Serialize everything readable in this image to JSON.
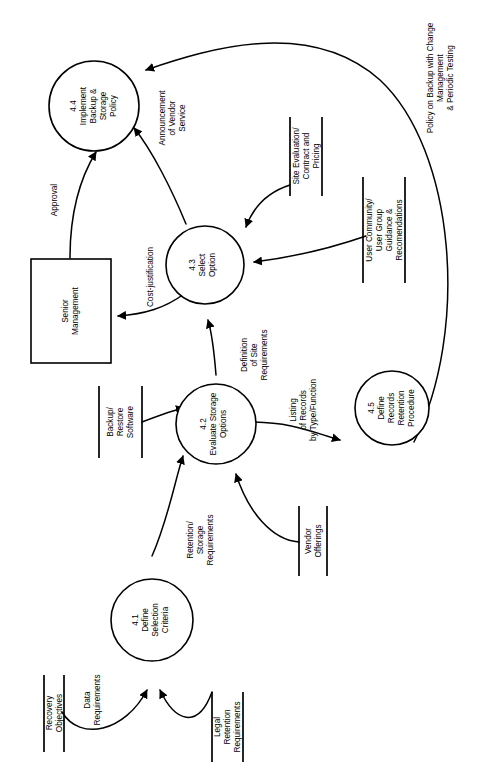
{
  "diagram": {
    "type": "data-flow-diagram",
    "orientation": "rotated-90-ccw",
    "processes": [
      {
        "id": "4.1",
        "number": "4.1",
        "name": "Define Selection Criteria",
        "lines": [
          "4.1",
          "Define",
          "Selection",
          "Criteria"
        ]
      },
      {
        "id": "4.2",
        "number": "4.2",
        "name": "Evaluate Storage Options",
        "lines": [
          "4.2",
          "Evaluate Storage",
          "Options"
        ]
      },
      {
        "id": "4.3",
        "number": "4.3",
        "name": "Select Option",
        "lines": [
          "4.3",
          "Select",
          "Option"
        ]
      },
      {
        "id": "4.4",
        "number": "4.4",
        "name": "Implement Backup & Storage Policy",
        "lines": [
          "4.4",
          "Implement",
          "Backup &",
          "Storage",
          "Policy"
        ]
      },
      {
        "id": "4.5",
        "number": "4.5",
        "name": "Define Records Retention Procedure",
        "lines": [
          "4.5",
          "Define",
          "Records",
          "Retention",
          "Procedure"
        ]
      }
    ],
    "external_entities": [
      {
        "id": "senior-management",
        "name": "Senior Management",
        "lines": [
          "Senior",
          "Management"
        ]
      }
    ],
    "data_stores": [
      {
        "id": "recovery-objectives",
        "name": "Recovery Objectives",
        "lines": [
          "Recovery",
          "Objectives"
        ]
      },
      {
        "id": "legal-retention-requirements",
        "name": "Legal Retention Requirements",
        "lines": [
          "Legal",
          "Retention",
          "Requirements"
        ]
      },
      {
        "id": "backup-restore-software",
        "name": "Backup/ Restore Software",
        "lines": [
          "Backup/",
          "Restore",
          "Software"
        ]
      },
      {
        "id": "vendor-offerings",
        "name": "Vendor Offerings",
        "lines": [
          "Vendor",
          "Offerings"
        ]
      },
      {
        "id": "site-evaluation-contract-pricing",
        "name": "Site Evaluation/ Contract and Pricing",
        "lines": [
          "Site Evaluation/",
          "Contract and",
          "Pricing"
        ]
      },
      {
        "id": "user-community-guidance",
        "name": "User Community/ User Group Guidance & Recomendations",
        "lines": [
          "User Community/",
          "User Group",
          "Guidance &",
          "Recomendations"
        ]
      }
    ],
    "data_flows": [
      {
        "id": "data-requirements",
        "label": "Data Requirements",
        "lines": [
          "Data",
          "Requirements"
        ],
        "from": "recovery-objectives",
        "to": "4.1"
      },
      {
        "id": "legal-to-41",
        "label": "",
        "lines": [],
        "from": "legal-retention-requirements",
        "to": "4.1"
      },
      {
        "id": "retention-storage-requirements",
        "label": "Retention/ Storage Requirements",
        "lines": [
          "Retention/",
          "Storage",
          "Requirements"
        ],
        "from": "4.1",
        "to": "4.2"
      },
      {
        "id": "backup-software-to-42",
        "label": "",
        "lines": [],
        "from": "backup-restore-software",
        "to": "4.2"
      },
      {
        "id": "vendor-offerings-to-42",
        "label": "",
        "lines": [],
        "from": "vendor-offerings",
        "to": "4.2"
      },
      {
        "id": "definition-of-site-requirements",
        "label": "Definition of Site Requirements",
        "lines": [
          "Definition",
          "of Site",
          "Requirements"
        ],
        "from": "4.2",
        "to": "4.3"
      },
      {
        "id": "listing-of-records",
        "label": "Listing of Records by Type/Function",
        "lines": [
          "Listing",
          "of Records",
          "by Type/Function"
        ],
        "from": "4.2",
        "to": "4.5"
      },
      {
        "id": "site-evaluation-to-43",
        "label": "",
        "lines": [],
        "from": "site-evaluation-contract-pricing",
        "to": "4.3"
      },
      {
        "id": "user-community-to-43",
        "label": "",
        "lines": [],
        "from": "user-community-guidance",
        "to": "4.3"
      },
      {
        "id": "cost-justification",
        "label": "Cost-justification",
        "lines": [
          "Cost-justification"
        ],
        "from": "4.3",
        "to": "senior-management"
      },
      {
        "id": "approval",
        "label": "Approval",
        "lines": [
          "Approval"
        ],
        "from": "senior-management",
        "to": "4.4"
      },
      {
        "id": "announcement-of-vendor-service",
        "label": "Announcement of Vendor Service",
        "lines": [
          "Announcement",
          "of Vendor",
          "Service"
        ],
        "from": "4.3",
        "to": "4.4"
      },
      {
        "id": "policy-on-backup",
        "label": "Policy on Backup with Change Management & Periodic Testing",
        "lines": [
          "Policy on Backup with Change",
          "Management",
          "& Periodic Testing"
        ],
        "from": "4.5",
        "to": "4.4"
      }
    ]
  }
}
